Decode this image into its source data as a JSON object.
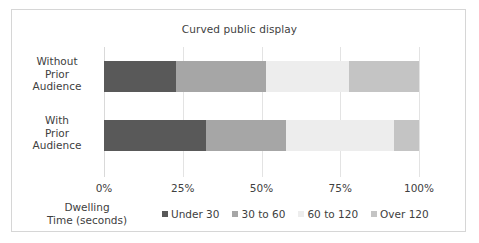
{
  "chart_data": {
    "type": "bar",
    "orientation": "horizontal",
    "stacked": true,
    "normalized": true,
    "title": "Curved public display",
    "xlabel": "",
    "ylabel": "Dwelling Time (seconds)",
    "categories": [
      "Without Prior Audience",
      "With Prior Audience"
    ],
    "category_lines": [
      [
        "Without",
        "Prior",
        "Audience"
      ],
      [
        "With",
        "Prior",
        "Audience"
      ]
    ],
    "xlim": [
      0,
      100
    ],
    "xticks": [
      0,
      25,
      50,
      75,
      100
    ],
    "xticklabels": [
      "0%",
      "25%",
      "50%",
      "75%",
      "100%"
    ],
    "grid": true,
    "legend_position": "bottom",
    "series": [
      {
        "name": "Under 30",
        "color": "#595959",
        "values": [
          23.0,
          32.4
        ]
      },
      {
        "name": "30 to 60",
        "color": "#a6a6a6",
        "values": [
          28.4,
          25.4
        ]
      },
      {
        "name": "60 to 120",
        "color": "#ededed",
        "values": [
          26.4,
          34.2
        ]
      },
      {
        "name": "Over 120",
        "color": "#c4c4c4",
        "values": [
          22.2,
          8.0
        ]
      }
    ]
  },
  "axis_title": {
    "line1": "Dwelling",
    "line2": "Time (seconds)"
  },
  "colors": {
    "frame": "#d6d6d6",
    "gridline": "#e3e3e3",
    "text": "#404040",
    "background": "#ffffff"
  }
}
